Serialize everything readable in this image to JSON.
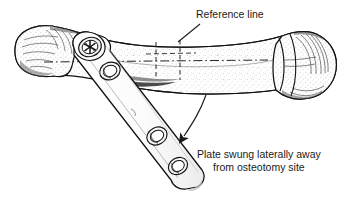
{
  "figure": {
    "type": "medical-illustration",
    "background_color": "#ffffff",
    "ink_color": "#1a1a1a",
    "width": 364,
    "height": 204
  },
  "labels": {
    "reference_line": "Reference line",
    "caption_line1": "Plate swung laterally away",
    "caption_line2": "from osteotomy site"
  },
  "annotations": {
    "leader_reference": "leader line from 'Reference line' text down-left to vertical dashed osteotomy line",
    "curved_arrow": "curved arrow from bone shaft sweeping down-left toward displaced plate"
  },
  "elements": {
    "bone": "long bone shown horizontally, flared condyle at left, rounded head with collar at right, stippled shaft",
    "plate": "metal bone plate angled down-left across bone, rounded top head, rounded bottom tip",
    "screw": "cruciform screw head seated in plate's proximal hole",
    "plate_holes": 4,
    "dashed_lines": "horizontal dash-dot long axis reference line plus two vertical dashed osteotomy lines"
  }
}
